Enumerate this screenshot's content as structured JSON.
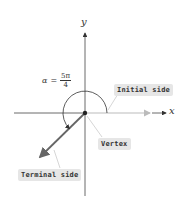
{
  "diagram": {
    "axes": {
      "x_label": "x",
      "y_label": "y"
    },
    "angle": {
      "symbol": "α",
      "equals": "=",
      "numerator": "5π",
      "denominator": "4"
    },
    "labels": {
      "initial_side": "Initial side",
      "vertex": "Vertex",
      "terminal_side": "Terminal side"
    },
    "colors": {
      "axis": "#444444",
      "terminal": "#666666",
      "initial": "#bbbbbb",
      "label_bg": "#e6e6e6"
    }
  }
}
